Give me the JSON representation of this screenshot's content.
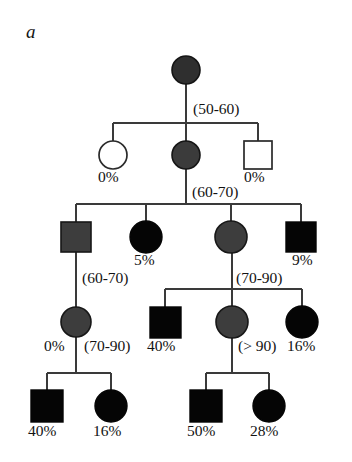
{
  "figure": {
    "panel_label": "a",
    "type": "pedigree-chart",
    "colors": {
      "affected_black": "#000000",
      "affected_gray": "#3b3b3b",
      "unaffected_white": "#ffffff",
      "line": "#3a3a3a",
      "text": "#121212"
    }
  },
  "individuals": [
    {
      "id": "I-1",
      "shape": "circle",
      "fill": "black-gray",
      "generation": 1,
      "cx": 186,
      "cy": 70,
      "r": 14
    },
    {
      "id": "II-1",
      "shape": "circle",
      "fill": "white",
      "generation": 2,
      "cx": 113,
      "cy": 155,
      "r": 14,
      "label": "0%"
    },
    {
      "id": "II-2",
      "shape": "circle",
      "fill": "black-gray",
      "generation": 2,
      "cx": 186,
      "cy": 155,
      "r": 14
    },
    {
      "id": "II-3",
      "shape": "square",
      "fill": "white",
      "generation": 2,
      "cx": 258,
      "cy": 155,
      "r": 14,
      "label": "0%"
    },
    {
      "id": "III-1",
      "shape": "square",
      "fill": "gray",
      "generation": 3,
      "cx": 76,
      "cy": 237,
      "r": 15
    },
    {
      "id": "III-2",
      "shape": "circle",
      "fill": "black",
      "generation": 3,
      "cx": 146,
      "cy": 237,
      "r": 16,
      "label": "5%"
    },
    {
      "id": "III-3",
      "shape": "circle",
      "fill": "gray",
      "generation": 3,
      "cx": 231,
      "cy": 237,
      "r": 16
    },
    {
      "id": "III-4",
      "shape": "square",
      "fill": "black",
      "generation": 3,
      "cx": 301,
      "cy": 237,
      "r": 15,
      "label": "9%"
    },
    {
      "id": "IV-1",
      "shape": "circle",
      "fill": "gray",
      "generation": 4,
      "cx": 76,
      "cy": 322,
      "r": 15,
      "label": "0%"
    },
    {
      "id": "IV-2",
      "shape": "square",
      "fill": "black",
      "generation": 4,
      "cx": 165,
      "cy": 322,
      "r": 15,
      "label": "40%"
    },
    {
      "id": "IV-3",
      "shape": "circle",
      "fill": "gray",
      "generation": 4,
      "cx": 232,
      "cy": 322,
      "r": 16
    },
    {
      "id": "IV-4",
      "shape": "circle",
      "fill": "black",
      "generation": 4,
      "cx": 302,
      "cy": 322,
      "r": 16,
      "label": "16%"
    },
    {
      "id": "V-1",
      "shape": "square",
      "fill": "black",
      "generation": 5,
      "cx": 47,
      "cy": 406,
      "r": 16,
      "label": "40%"
    },
    {
      "id": "V-2",
      "shape": "circle",
      "fill": "black",
      "generation": 5,
      "cx": 111,
      "cy": 406,
      "r": 16,
      "label": "16%"
    },
    {
      "id": "V-3",
      "shape": "square",
      "fill": "black",
      "generation": 5,
      "cx": 206,
      "cy": 406,
      "r": 16,
      "label": "50%"
    },
    {
      "id": "V-4",
      "shape": "circle",
      "fill": "black",
      "generation": 5,
      "cx": 269,
      "cy": 406,
      "r": 16,
      "label": "28%"
    }
  ],
  "age_annotations": [
    {
      "text": "(50-60)",
      "x": 193,
      "y": 108,
      "for": "I-1"
    },
    {
      "text": "(60-70)",
      "x": 192,
      "y": 191,
      "for": "II-2"
    },
    {
      "text": "(70-90)",
      "x": 236,
      "y": 277,
      "for": "III-3"
    },
    {
      "text": "(60-70)",
      "x": 82,
      "y": 277,
      "for": "III-1"
    },
    {
      "text": "(70-90)",
      "x": 84,
      "y": 345,
      "for": "IV-1"
    },
    {
      "text": "(> 90)",
      "x": 238,
      "y": 345,
      "for": "IV-3"
    }
  ],
  "percent_annotations": [
    {
      "text": "0%",
      "x": 98,
      "y": 176,
      "for": "II-1"
    },
    {
      "text": "0%",
      "x": 244,
      "y": 176,
      "for": "II-3"
    },
    {
      "text": "5%",
      "x": 134,
      "y": 259,
      "for": "III-2"
    },
    {
      "text": "9%",
      "x": 292,
      "y": 259,
      "for": "III-4"
    },
    {
      "text": "0%",
      "x": 44,
      "y": 345,
      "for": "IV-1"
    },
    {
      "text": "40%",
      "x": 147,
      "y": 345,
      "for": "IV-2"
    },
    {
      "text": "16%",
      "x": 287,
      "y": 345,
      "for": "IV-4"
    },
    {
      "text": "40%",
      "x": 28,
      "y": 430,
      "for": "V-1"
    },
    {
      "text": "16%",
      "x": 93,
      "y": 430,
      "for": "V-2"
    },
    {
      "text": "50%",
      "x": 187,
      "y": 430,
      "for": "V-3"
    },
    {
      "text": "28%",
      "x": 250,
      "y": 430,
      "for": "V-4"
    }
  ]
}
